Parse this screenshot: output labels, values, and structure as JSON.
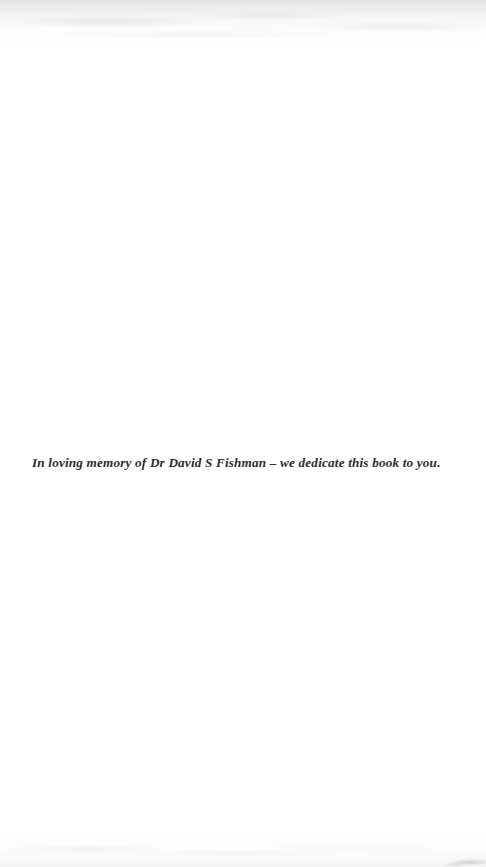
{
  "document": {
    "type": "book-dedication-page",
    "page_background_color": "#ffffff",
    "ink_color": "#2b2b31",
    "dedication": {
      "text": "In loving memory of Dr David S Fishman – we dedicate this book to you.",
      "style": "bold-italic-serif"
    },
    "artifacts": {
      "top_edge_shading_label": "scanner shadow along top edge",
      "bottom_edge_shading_label": "scanner shadow along bottom edge",
      "corner_smudge_label": "gray smudge at bottom-right corner"
    }
  }
}
